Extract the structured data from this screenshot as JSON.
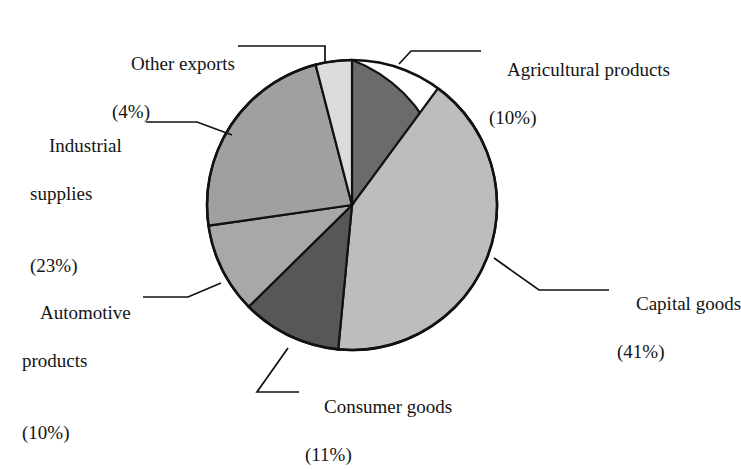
{
  "chart_data": {
    "type": "pie",
    "title": "",
    "subtitle": "",
    "xlabel": "",
    "ylabel": "",
    "legend_position": "none",
    "grid": false,
    "labels_style": "leader-line callouts around pie",
    "start_angle_deg": 0,
    "direction": "clockwise",
    "categories": [
      "Agricultural products",
      "Capital goods",
      "Consumer goods",
      "Automotive products",
      "Industrial supplies",
      "Other exports"
    ],
    "values": [
      10,
      41,
      11,
      10,
      23,
      4
    ],
    "unit": "%",
    "total": 99,
    "slices": [
      {
        "name": "Agricultural products",
        "value": 10,
        "percent_text": "(10%)",
        "color": "#6b6b6b",
        "start_deg": 0,
        "end_deg": 36
      },
      {
        "name": "Capital goods",
        "value": 41,
        "percent_text": "(41%)",
        "color": "#bdbdbd",
        "start_deg": 36,
        "end_deg": 183.5
      },
      {
        "name": "Consumer goods",
        "value": 11,
        "percent_text": "(11%)",
        "color": "#575757",
        "start_deg": 183.5,
        "end_deg": 223.1
      },
      {
        "name": "Automotive products",
        "value": 10,
        "percent_text": "(10%)",
        "color": "#a8a8a8",
        "start_deg": 223.1,
        "end_deg": 259.1
      },
      {
        "name": "Industrial supplies",
        "value": 23,
        "percent_text": "(23%)",
        "color": "#a0a0a0",
        "start_deg": 259.1,
        "end_deg": 341.9
      },
      {
        "name": "Other exports",
        "value": 4,
        "percent_text": "(4%)",
        "color": "#dcdcdc",
        "start_deg": 341.9,
        "end_deg": 356.3
      }
    ]
  },
  "labels": {
    "agricultural": {
      "line1": "Agricultural products",
      "line2": "(10%)"
    },
    "capital": {
      "line1": "Capital goods",
      "line2": "(41%)"
    },
    "consumer": {
      "line1": "Consumer goods",
      "line2": "(11%)"
    },
    "automotive": {
      "line1": "Automotive",
      "line2": "products",
      "line3": "(10%)"
    },
    "industrial": {
      "line1": "Industrial",
      "line2": "supplies",
      "line3": "(23%)"
    },
    "other": {
      "line1": "Other exports",
      "line2": "(4%)"
    }
  },
  "style": {
    "background": "#ffffff",
    "outline": "#111111",
    "text": "#141414"
  }
}
